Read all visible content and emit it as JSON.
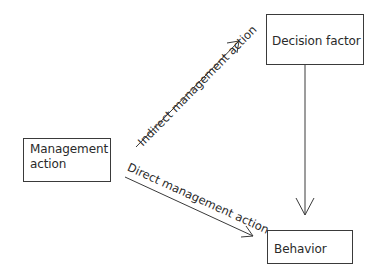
{
  "diagram": {
    "nodes": {
      "management_action": {
        "line1": "Management",
        "line2": "action"
      },
      "decision_factor": {
        "label": "Decision factor"
      },
      "behavior": {
        "label": "Behavior"
      }
    },
    "edges": {
      "indirect": {
        "label": "Indirect management action",
        "from": "management_action",
        "to": "decision_factor"
      },
      "direct": {
        "label": "Direct management action",
        "from": "management_action",
        "to": "behavior"
      },
      "decision_to_behavior": {
        "label": "",
        "from": "decision_factor",
        "to": "behavior"
      }
    },
    "colors": {
      "line": "#3a3a3a",
      "text": "#2a2a2a",
      "background": "#ffffff"
    }
  }
}
